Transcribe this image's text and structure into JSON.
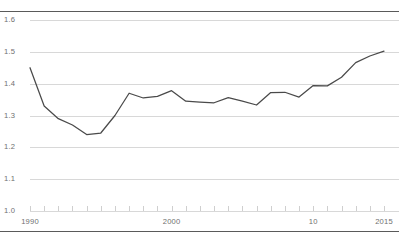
{
  "chart_data": {
    "type": "line",
    "title": "",
    "subtitle": "",
    "xlabel": "",
    "ylabel": "",
    "xlim": [
      1990,
      2015
    ],
    "ylim": [
      1.0,
      1.6
    ],
    "grid": true,
    "legend": "none",
    "line_color": "#4a4a4a",
    "grid_color": "#d8d8d8",
    "axis_rule_color": "#5a5a5a",
    "y_ticks": [
      "1.0",
      "1.1",
      "1.2",
      "1.3",
      "1.4",
      "1.5",
      "1.6"
    ],
    "y_tick_values": [
      1.0,
      1.1,
      1.2,
      1.3,
      1.4,
      1.5,
      1.6
    ],
    "x_ticks": [
      "1990",
      "2000",
      "10",
      "2015"
    ],
    "x_tick_values": [
      1990,
      2000,
      2010,
      2015
    ],
    "x_minor_tick_values": [
      1991,
      1992,
      1993,
      1994,
      1995,
      1996,
      1997,
      1998,
      1999,
      2001,
      2002,
      2003,
      2004,
      2005,
      2006,
      2007,
      2008,
      2009,
      2011,
      2012,
      2013,
      2014
    ],
    "series": [
      {
        "name": "value",
        "x": [
          1990,
          1991,
          1992,
          1993,
          1994,
          1995,
          1996,
          1997,
          1998,
          1999,
          2000,
          2001,
          2002,
          2003,
          2004,
          2005,
          2006,
          2007,
          2008,
          2009,
          2010,
          2011,
          2012,
          2013,
          2014,
          2015
        ],
        "values": [
          1.45,
          1.33,
          1.29,
          1.27,
          1.24,
          1.245,
          1.3,
          1.37,
          1.355,
          1.36,
          1.378,
          1.345,
          1.342,
          1.34,
          1.356,
          1.345,
          1.333,
          1.372,
          1.373,
          1.358,
          1.394,
          1.393,
          1.42,
          1.466,
          1.487,
          1.502
        ]
      }
    ]
  }
}
